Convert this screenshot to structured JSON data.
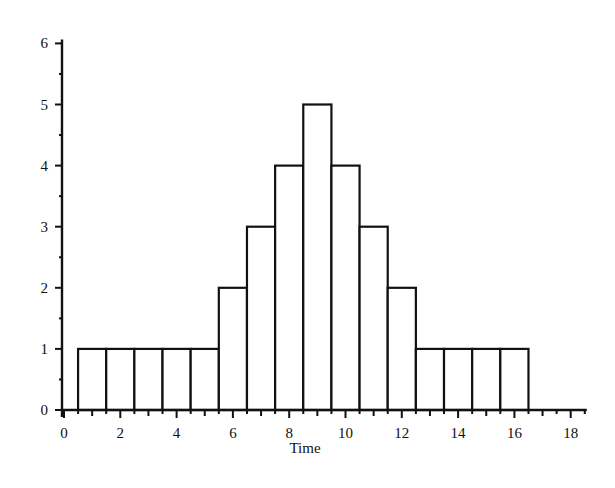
{
  "chart_data": {
    "type": "bar",
    "title": "",
    "xlabel": "Time",
    "ylabel": "",
    "categories": [
      1,
      2,
      3,
      4,
      5,
      6,
      7,
      8,
      9,
      10,
      11,
      12,
      13,
      14,
      15,
      16
    ],
    "values": [
      1,
      1,
      1,
      1,
      1,
      2,
      3,
      4,
      5,
      4,
      3,
      2,
      1,
      1,
      1,
      1
    ],
    "bar_width": 1,
    "xlim": [
      0,
      18.5
    ],
    "ylim": [
      0,
      6
    ],
    "x_ticks": [
      0,
      2,
      4,
      6,
      8,
      10,
      12,
      14,
      16,
      18
    ],
    "y_ticks": [
      0,
      1,
      2,
      3,
      4,
      5,
      6
    ],
    "grid": false,
    "legend": null,
    "style": {
      "bar_fill": "#ffffff",
      "bar_stroke": "#111111",
      "axis_color": "#111111"
    }
  }
}
